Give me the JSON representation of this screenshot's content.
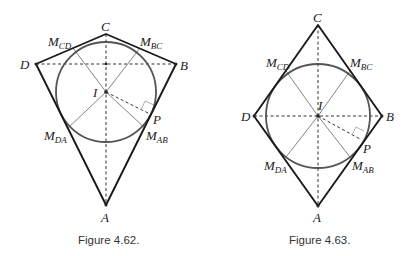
{
  "figures": [
    {
      "id": "fig-4-62",
      "caption": "Figure 4.62.",
      "shape": "kite",
      "points": {
        "A": {
          "label": "A",
          "x": 106,
          "y": 205
        },
        "B": {
          "label": "B",
          "x": 176,
          "y": 64
        },
        "C": {
          "label": "C",
          "x": 106,
          "y": 34
        },
        "D": {
          "label": "D",
          "x": 36,
          "y": 64
        },
        "I": {
          "label": "I",
          "x": 106,
          "y": 92
        },
        "P": {
          "label": "P",
          "x": 148,
          "y": 113
        },
        "M_CD": {
          "label": "M",
          "sub": "CD",
          "x": 73,
          "y": 48
        },
        "M_BC": {
          "label": "M",
          "sub": "BC",
          "x": 140,
          "y": 48
        },
        "M_DA": {
          "label": "M",
          "sub": "DA",
          "x": 68,
          "y": 128
        },
        "M_AB": {
          "label": "M",
          "sub": "AB",
          "x": 145,
          "y": 128
        }
      },
      "incircle": {
        "cx": 106,
        "cy": 92,
        "r": 50
      }
    },
    {
      "id": "fig-4-63",
      "caption": "Figure 4.63.",
      "shape": "rhombus",
      "points": {
        "A": {
          "label": "A",
          "x": 318,
          "y": 206
        },
        "B": {
          "label": "B",
          "x": 382,
          "y": 116
        },
        "C": {
          "label": "C",
          "x": 318,
          "y": 25
        },
        "D": {
          "label": "D",
          "x": 254,
          "y": 116
        },
        "I": {
          "label": "I",
          "x": 318,
          "y": 116
        },
        "P": {
          "label": "P",
          "x": 360,
          "y": 139
        },
        "M_CD": {
          "label": "M",
          "sub": "CD",
          "x": 286,
          "y": 71
        },
        "M_BC": {
          "label": "M",
          "sub": "BC",
          "x": 350,
          "y": 71
        },
        "M_DA": {
          "label": "M",
          "sub": "DA",
          "x": 286,
          "y": 157
        },
        "M_AB": {
          "label": "M",
          "sub": "AB",
          "x": 350,
          "y": 157
        }
      },
      "incircle": {
        "cx": 318,
        "cy": 116,
        "r": 52
      }
    }
  ]
}
